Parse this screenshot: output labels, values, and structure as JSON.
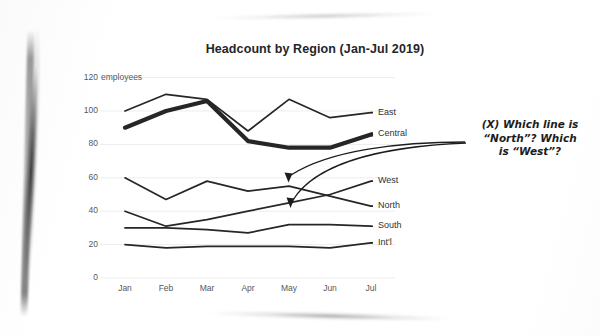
{
  "page": {
    "kind": "scanned-page-screenshot",
    "background_color": "#ffffff"
  },
  "chart_data": {
    "type": "line",
    "title": "Headcount by Region (Jan-Jul 2019)",
    "xlabel": "",
    "ylabel": "",
    "y_unit_label": "employees",
    "categories": [
      "Jan",
      "Feb",
      "Mar",
      "Apr",
      "May",
      "Jun",
      "Jul"
    ],
    "ylim": [
      0,
      120
    ],
    "yticks": [
      0,
      20,
      40,
      60,
      80,
      100,
      120
    ],
    "grid": true,
    "legend_position": "right-inline-labels",
    "series": [
      {
        "name": "East",
        "values": [
          100,
          110,
          107,
          88,
          107,
          96,
          99
        ],
        "emphasis": "normal"
      },
      {
        "name": "Central",
        "values": [
          90,
          100,
          106,
          82,
          78,
          78,
          86
        ],
        "emphasis": "bold"
      },
      {
        "name": "North",
        "values": [
          60,
          47,
          58,
          52,
          55,
          49,
          43
        ],
        "emphasis": "normal"
      },
      {
        "name": "West",
        "values": [
          40,
          31,
          35,
          40,
          45,
          50,
          58
        ],
        "emphasis": "normal"
      },
      {
        "name": "South",
        "values": [
          30,
          30,
          29,
          27,
          32,
          32,
          31
        ],
        "emphasis": "normal"
      },
      {
        "name": "Int'l",
        "values": [
          20,
          18,
          19,
          19,
          19,
          18,
          21
        ],
        "emphasis": "normal"
      }
    ],
    "annotations": [
      {
        "marker": "(X)",
        "text_line_1": "(X) Which line is",
        "text_line_2": "“North”? Which",
        "text_line_3": "is “West”?",
        "full_text": "(X) Which line is “North”? Which is “West”?",
        "points_to": [
          "North",
          "West"
        ]
      }
    ],
    "colors": {
      "line": "#262626",
      "grid": "#ededed",
      "tick_text": "#55585c",
      "title_text": "#23262a",
      "annotation_text": "#1d1d1d"
    }
  }
}
